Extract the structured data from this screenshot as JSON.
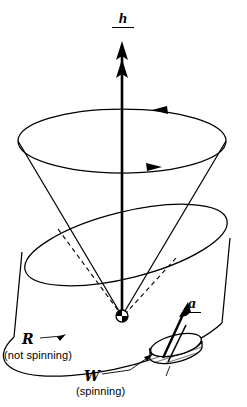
{
  "figure": {
    "background_color": "#ffffff",
    "ink_color": "#000000",
    "width": 247,
    "height": 407
  },
  "labels": {
    "angular_momentum": {
      "symbol": "h",
      "notation": "underlined-vector",
      "description": "vertical precession axis arrow"
    },
    "acceleration": {
      "symbol": "a",
      "notation": "underlined-vector",
      "description": "arrow from spinning wheel"
    },
    "frame_R": {
      "symbol": "R",
      "caption": "(not spinning)",
      "style": "script"
    },
    "frame_W": {
      "symbol": "W",
      "caption": "(spinning)",
      "style": "script"
    }
  },
  "geometry": {
    "axis": {
      "x": 122,
      "top_y": 44,
      "bottom_y": 318,
      "arrowheads": 2,
      "direction": "up"
    },
    "cone": {
      "rim_center_x": 122,
      "rim_center_y": 141,
      "rim_rx": 104,
      "rim_ry": 32,
      "apex_x": 122,
      "apex_y": 316,
      "circulation": "clockwise-viewed-from-above"
    },
    "cylinder": {
      "tilt_deg": -14,
      "top_center_x": 126,
      "top_center_y": 245,
      "bottom_center_x": 118,
      "bottom_center_y": 330,
      "rx": 104,
      "ry": 33
    },
    "bob": {
      "cx": 122,
      "cy": 316,
      "r": 6,
      "style": "checkered-sphere"
    },
    "wheel": {
      "cx": 176,
      "cy": 350,
      "rx": 26,
      "ry": 10,
      "thickness": 7,
      "rim": "hatched",
      "axle": true
    }
  }
}
